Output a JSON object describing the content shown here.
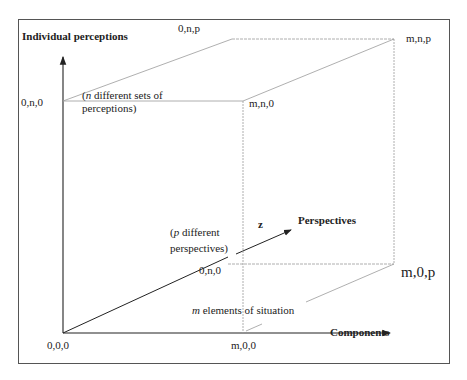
{
  "figure": {
    "type": "3d-cube-axes-diagram",
    "axes": {
      "y": {
        "label": "Individual perceptions"
      },
      "x": {
        "label": "Components"
      },
      "z": {
        "label": "Perspectives",
        "symbol": "z"
      }
    },
    "vertices": {
      "origin": "0,0,0",
      "x_end": "m,0,0",
      "y_end": "0,n,0",
      "xy": "m,n,0",
      "yz": "0,n,p",
      "xyz": "m,n,p",
      "xz": "m,0,p",
      "yz_inner": "0,n,0"
    },
    "annotations": {
      "y_note_prefix": "(",
      "y_note_var": "n",
      "y_note_rest": " different sets of",
      "y_note_line2": "perceptions)",
      "z_note_prefix": "(",
      "z_note_var": "p",
      "z_note_rest": " different",
      "z_note_line2": "perspectives)",
      "x_note_var": "m",
      "x_note_rest": " elements of situation"
    },
    "colors": {
      "axis": "#222222",
      "edge": "#9a9a9a",
      "frame": "#555555"
    }
  }
}
